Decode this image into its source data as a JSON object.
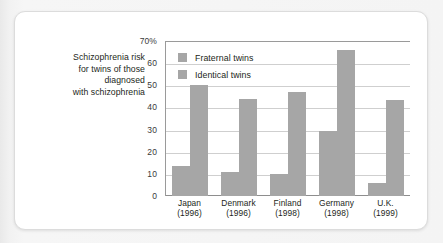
{
  "caption": {
    "lines": [
      "Schizophrenia risk",
      "for twins of those",
      "diagnosed",
      "with schizophrenia"
    ]
  },
  "colors": {
    "bar": "#a6a6a6",
    "gridline": "#cfcfcf",
    "axis": "#9a9a9a",
    "text": "#231f20",
    "card_background": "#ffffff",
    "page_background": "#f2f2f2"
  },
  "chart_data": {
    "type": "bar",
    "title": "",
    "xlabel": "",
    "ylabel": "",
    "ylim": [
      0,
      70
    ],
    "grid": true,
    "legend_position": "top-left",
    "categories": [
      "Japan",
      "Denmark",
      "Finland",
      "Germany",
      "U.K."
    ],
    "category_years": [
      "(1996)",
      "(1996)",
      "(1998)",
      "(1998)",
      "(1999)"
    ],
    "ticks": [
      {
        "value": 70,
        "label": "70%"
      },
      {
        "value": 60,
        "label": "60"
      },
      {
        "value": 50,
        "label": "50"
      },
      {
        "value": 40,
        "label": "40"
      },
      {
        "value": 30,
        "label": "30"
      },
      {
        "value": 20,
        "label": "20"
      },
      {
        "value": 10,
        "label": "10"
      },
      {
        "value": 0,
        "label": "0"
      }
    ],
    "series": [
      {
        "name": "Fraternal twins",
        "values": [
          13.5,
          10.7,
          10,
          29.5,
          6
        ]
      },
      {
        "name": "Identical twins",
        "values": [
          50,
          44,
          47,
          66,
          43.5
        ]
      }
    ]
  }
}
